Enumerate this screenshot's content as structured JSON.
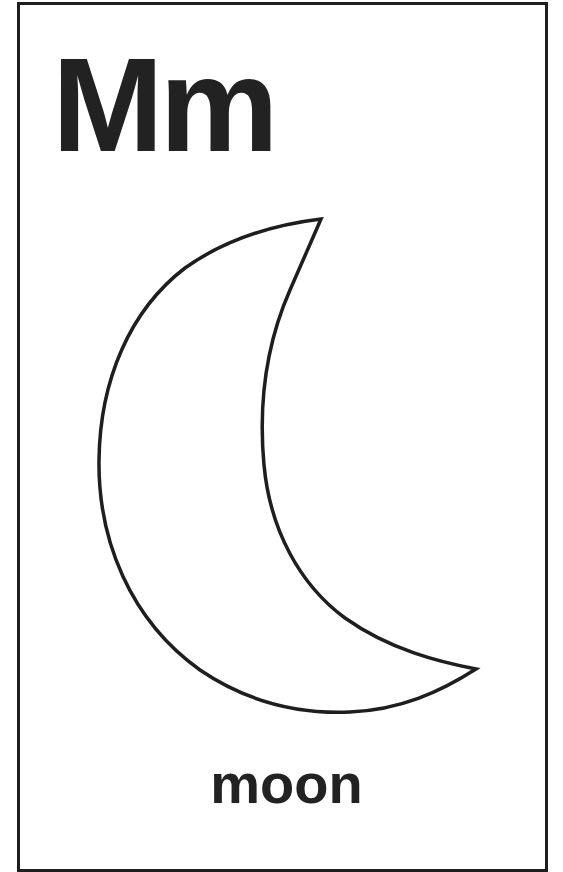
{
  "card": {
    "letter": "Mm",
    "word": "moon",
    "illustration": "crescent-moon",
    "colors": {
      "ink": "#222222",
      "border": "#1e1e1e",
      "background": "#ffffff"
    }
  }
}
